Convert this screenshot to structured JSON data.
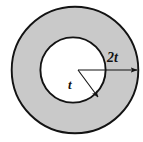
{
  "figure": {
    "name": "annulus-cross-section-diagram",
    "background_color": "#ffffff",
    "annulus_fill_color": "#c9c9c9",
    "inner_fill_color": "#ffffff",
    "stroke_color": "#131313",
    "outer_circle": {
      "center_x": 75,
      "center_y": 70,
      "radius": 64,
      "stroke_width": 1.9
    },
    "inner_circle": {
      "center_x": 73,
      "center_y": 70,
      "radius": 33,
      "stroke_width": 1.9
    },
    "center_point": {
      "x": 78,
      "y": 70
    },
    "dimensions": [
      {
        "id": "outer-radius",
        "label": "2t",
        "arrow_from_x": 78,
        "arrow_from_y": 70,
        "arrow_to_x": 138,
        "arrow_to_y": 70,
        "label_x": 107,
        "label_y": 51
      },
      {
        "id": "inner-radius",
        "label": "t",
        "arrow_from_x": 78,
        "arrow_from_y": 70,
        "arrow_to_x": 99,
        "arrow_to_y": 98,
        "label_x": 68,
        "label_y": 78
      }
    ]
  }
}
